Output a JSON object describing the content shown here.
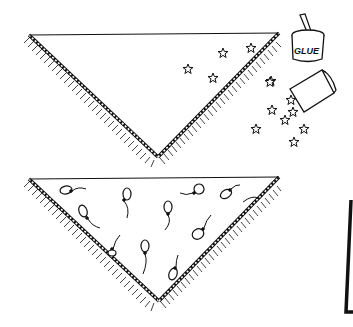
{
  "illustration": {
    "description": "Two triangular fringed scarves: top one being decorated with glitter stars from a glue jar and an overturned box; bottom one decorated with balloons",
    "ink_color": "#111111",
    "background": "#ffffff"
  },
  "top_scarf": {
    "decoration": "stars",
    "star_count_on_scarf": 5
  },
  "glue_jar": {
    "label": "GLUE"
  },
  "spilled_box": {
    "contents": "stars",
    "spilled_star_count": 8
  },
  "bottom_scarf": {
    "decoration": "balloons",
    "balloon_count": 11
  },
  "right_edge_frame": {
    "description": "partial black frame edge at right"
  }
}
